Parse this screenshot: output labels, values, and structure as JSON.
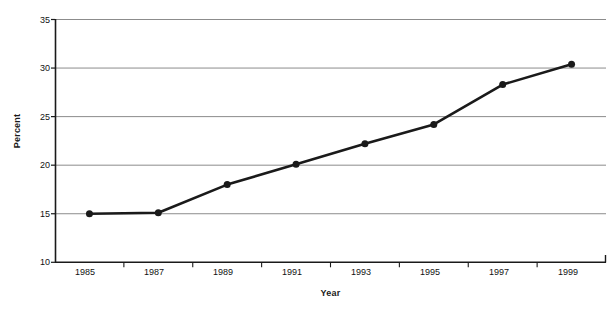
{
  "chart_data": {
    "type": "line",
    "title": "",
    "xlabel": "Year",
    "ylabel": "Percent",
    "x": [
      1985,
      1987,
      1989,
      1991,
      1993,
      1995,
      1997,
      1999
    ],
    "categories": [
      "1985",
      "1987",
      "1989",
      "1991",
      "1993",
      "1995",
      "1997",
      "1999"
    ],
    "values": [
      15.0,
      15.1,
      18.0,
      20.1,
      22.2,
      24.2,
      28.3,
      30.4
    ],
    "series": [
      {
        "name": "Percent",
        "values": [
          15.0,
          15.1,
          18.0,
          20.1,
          22.2,
          24.2,
          28.3,
          30.4
        ]
      }
    ],
    "ylim": [
      10,
      35
    ],
    "yticks": [
      10,
      15,
      20,
      25,
      30,
      35
    ],
    "ytick_labels": [
      "10",
      "15",
      "20",
      "25",
      "30",
      "35"
    ],
    "xtick_labels": [
      "1985",
      "1987",
      "1989",
      "1991",
      "1993",
      "1995",
      "1997",
      "1999"
    ],
    "grid": "horizontal",
    "legend": "none",
    "line_color": "#1a1a1a",
    "marker": "circle",
    "marker_color": "#1a1a1a",
    "grid_color": "#8c8c8c",
    "axis_color": "#1a1a1a",
    "background": "#ffffff"
  },
  "axes": {
    "y_title": "Percent",
    "x_title": "Year"
  }
}
